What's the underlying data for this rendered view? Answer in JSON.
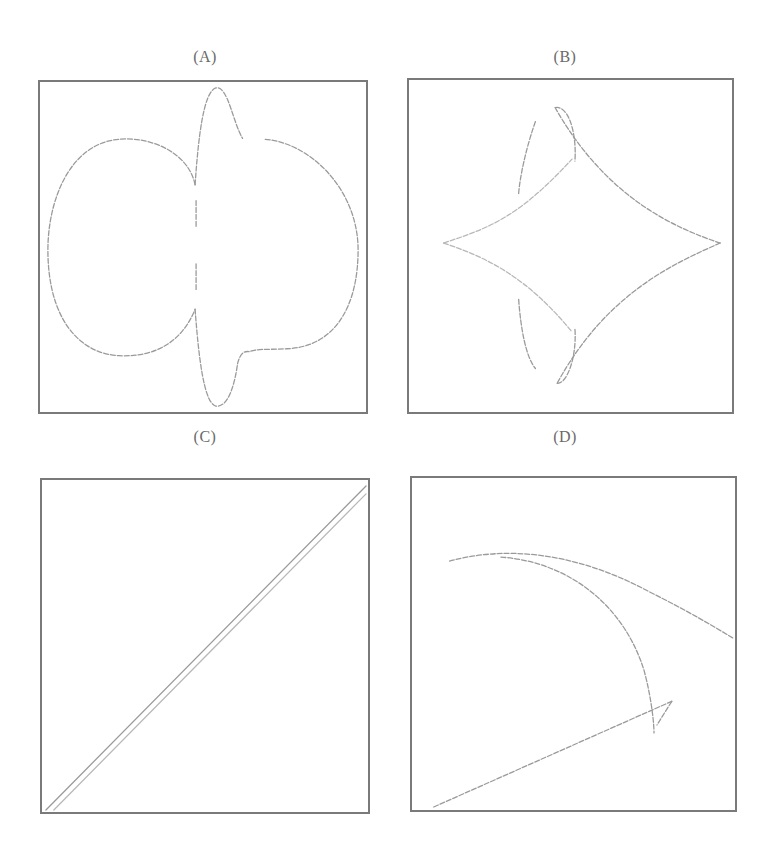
{
  "figure": {
    "panels": [
      {
        "id": "A",
        "label": "(A)",
        "description": "Two-lobed closed curve with a sharp vertical oscillation through the center"
      },
      {
        "id": "B",
        "label": "(B)",
        "description": "Four-cusped astroid-like star with two side arcs on the left"
      },
      {
        "id": "C",
        "label": "(C)",
        "description": "Double diagonal line from bottom-left to top-right"
      },
      {
        "id": "D",
        "label": "(D)",
        "description": "Arched curve splitting into two branches, with a straight line rising from bottom-left to a small loop"
      }
    ]
  },
  "colors": {
    "frame": "#7a7a7a",
    "curve": "#9a9a9a",
    "curve_light": "#b8b8b8",
    "label": "#6a6a6a",
    "background": "#ffffff"
  }
}
